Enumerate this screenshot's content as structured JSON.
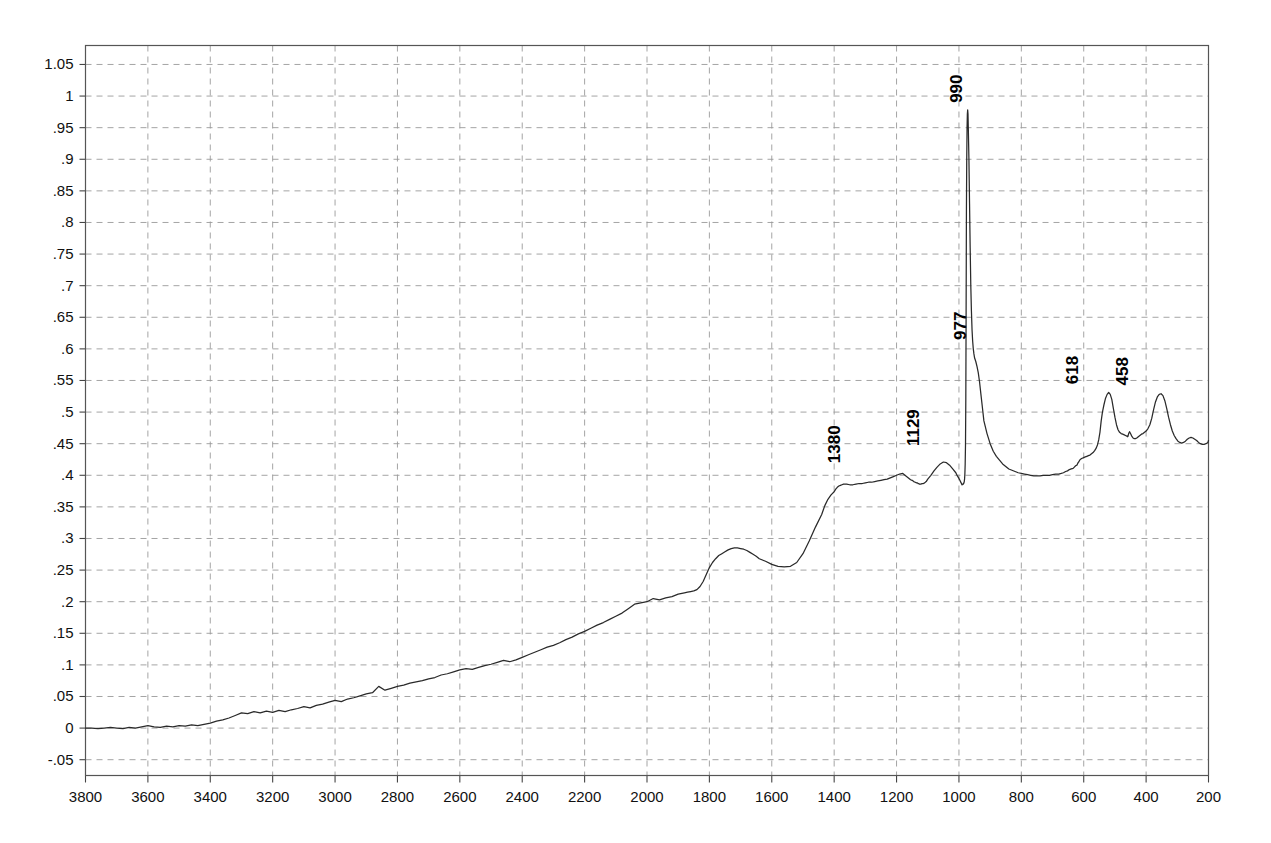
{
  "figure": {
    "kind": "spectrum-plot",
    "background": "#ffffff",
    "line_color": "#2a2a2a",
    "grid_color": "#9a9a9a"
  },
  "chart_data": {
    "type": "line",
    "title": "",
    "subtitle": "",
    "xlabel": "",
    "ylabel": "",
    "grid": true,
    "legend": "none",
    "xlim": [
      3800,
      200
    ],
    "ylim": [
      -0.075,
      1.08
    ],
    "x_axis_reversed": true,
    "xticks": [
      3800,
      3600,
      3400,
      3200,
      3000,
      2800,
      2600,
      2400,
      2200,
      2000,
      1800,
      1600,
      1400,
      1200,
      1000,
      800,
      600,
      400,
      200
    ],
    "xtick_labels": [
      "3800",
      "3600",
      "3400",
      "3200",
      "3000",
      "2800",
      "2600",
      "2400",
      "2200",
      "2000",
      "1800",
      "1600",
      "1400",
      "1200",
      "1000",
      "800",
      "600",
      "400",
      "200"
    ],
    "yticks": [
      1.05,
      1,
      0.95,
      0.9,
      0.85,
      0.8,
      0.75,
      0.7,
      0.65,
      0.6,
      0.55,
      0.5,
      0.45,
      0.4,
      0.35,
      0.3,
      0.25,
      0.2,
      0.15,
      0.1,
      0.05,
      0,
      -0.05
    ],
    "ytick_labels": [
      "1.05",
      "1",
      ".95",
      ".9",
      ".85",
      ".8",
      ".75",
      ".7",
      ".65",
      ".6",
      ".55",
      ".5",
      ".45",
      ".4",
      ".35",
      ".3",
      ".25",
      ".2",
      ".15",
      ".1",
      ".05",
      "0",
      "-.05"
    ],
    "annotations": [
      {
        "label": "1380",
        "x": 1380,
        "y": 0.405,
        "rotation": -90
      },
      {
        "label": "1129",
        "x": 1129,
        "y": 0.432,
        "rotation": -90
      },
      {
        "label": "990",
        "x": 990,
        "y": 0.975,
        "rotation": -90
      },
      {
        "label": "977",
        "x": 977,
        "y": 0.6,
        "rotation": -90
      },
      {
        "label": "618",
        "x": 618,
        "y": 0.53,
        "rotation": -90
      },
      {
        "label": "458",
        "x": 458,
        "y": 0.528,
        "rotation": -90
      }
    ],
    "x": [
      3800,
      3780,
      3760,
      3740,
      3720,
      3700,
      3680,
      3660,
      3640,
      3620,
      3600,
      3580,
      3560,
      3540,
      3520,
      3500,
      3480,
      3460,
      3440,
      3420,
      3400,
      3380,
      3360,
      3340,
      3320,
      3300,
      3280,
      3260,
      3240,
      3220,
      3200,
      3180,
      3160,
      3140,
      3120,
      3100,
      3080,
      3060,
      3040,
      3020,
      3000,
      2980,
      2960,
      2940,
      2920,
      2900,
      2880,
      2860,
      2840,
      2820,
      2800,
      2780,
      2760,
      2740,
      2720,
      2700,
      2680,
      2660,
      2640,
      2620,
      2600,
      2580,
      2560,
      2540,
      2520,
      2500,
      2480,
      2460,
      2440,
      2420,
      2400,
      2380,
      2360,
      2340,
      2320,
      2300,
      2280,
      2260,
      2240,
      2220,
      2200,
      2180,
      2160,
      2140,
      2120,
      2100,
      2080,
      2060,
      2040,
      2020,
      2000,
      1980,
      1960,
      1940,
      1920,
      1900,
      1880,
      1870,
      1860,
      1850,
      1840,
      1830,
      1820,
      1810,
      1800,
      1790,
      1780,
      1770,
      1760,
      1750,
      1740,
      1730,
      1720,
      1710,
      1700,
      1690,
      1680,
      1670,
      1660,
      1650,
      1640,
      1620,
      1600,
      1580,
      1560,
      1540,
      1520,
      1500,
      1480,
      1460,
      1440,
      1430,
      1420,
      1410,
      1400,
      1395,
      1390,
      1385,
      1380,
      1375,
      1370,
      1365,
      1360,
      1350,
      1340,
      1330,
      1320,
      1310,
      1300,
      1290,
      1280,
      1270,
      1260,
      1250,
      1240,
      1230,
      1220,
      1210,
      1200,
      1190,
      1180,
      1175,
      1170,
      1165,
      1160,
      1155,
      1150,
      1145,
      1140,
      1136,
      1133,
      1131,
      1129,
      1127,
      1125,
      1122,
      1118,
      1114,
      1110,
      1105,
      1100,
      1090,
      1080,
      1070,
      1060,
      1050,
      1040,
      1030,
      1020,
      1010,
      1005,
      1000,
      997,
      995,
      993,
      992,
      991,
      990.5,
      990,
      989.5,
      989,
      988,
      987,
      986,
      985,
      984,
      983,
      982,
      981,
      980,
      979,
      978,
      977,
      976,
      975,
      974,
      973,
      972,
      971,
      970,
      968,
      966,
      964,
      962,
      960,
      958,
      956,
      954,
      952,
      950,
      946,
      942,
      938,
      934,
      930,
      925,
      920,
      910,
      900,
      890,
      880,
      870,
      860,
      850,
      840,
      830,
      820,
      810,
      800,
      790,
      780,
      770,
      760,
      750,
      740,
      730,
      720,
      710,
      700,
      690,
      680,
      672,
      665,
      658,
      652,
      646,
      640,
      634,
      630,
      626,
      622,
      620,
      618,
      616,
      614,
      611,
      608,
      605,
      600,
      595,
      590,
      585,
      580,
      575,
      570,
      565,
      560,
      556,
      552,
      548,
      544,
      540,
      535,
      530,
      525,
      520,
      515,
      510,
      505,
      500,
      495,
      490,
      485,
      480,
      475,
      470,
      466,
      462,
      459,
      458,
      456,
      453,
      450,
      446,
      442,
      438,
      434,
      430,
      425,
      420,
      415,
      410,
      405,
      400,
      394,
      388,
      382,
      376,
      370,
      364,
      358,
      352,
      346,
      340,
      334,
      328,
      322,
      316,
      310,
      304,
      298,
      292,
      286,
      280,
      274,
      268,
      262,
      256,
      250,
      244,
      238,
      232,
      226,
      220,
      214,
      208,
      202,
      200
    ],
    "y": [
      0.0,
      0.0,
      -0.001,
      0.0,
      0.001,
      0.0,
      -0.001,
      0.001,
      0.0,
      0.002,
      0.004,
      0.002,
      0.001,
      0.003,
      0.002,
      0.004,
      0.003,
      0.005,
      0.004,
      0.006,
      0.008,
      0.011,
      0.013,
      0.016,
      0.02,
      0.024,
      0.023,
      0.026,
      0.024,
      0.027,
      0.025,
      0.028,
      0.026,
      0.029,
      0.031,
      0.034,
      0.032,
      0.036,
      0.038,
      0.041,
      0.044,
      0.042,
      0.046,
      0.048,
      0.051,
      0.054,
      0.056,
      0.066,
      0.06,
      0.063,
      0.066,
      0.068,
      0.071,
      0.073,
      0.075,
      0.078,
      0.08,
      0.084,
      0.086,
      0.089,
      0.092,
      0.094,
      0.093,
      0.096,
      0.099,
      0.101,
      0.104,
      0.107,
      0.105,
      0.108,
      0.112,
      0.116,
      0.12,
      0.124,
      0.128,
      0.131,
      0.135,
      0.14,
      0.144,
      0.149,
      0.153,
      0.158,
      0.163,
      0.167,
      0.172,
      0.177,
      0.182,
      0.189,
      0.196,
      0.198,
      0.2,
      0.205,
      0.203,
      0.206,
      0.208,
      0.212,
      0.214,
      0.215,
      0.216,
      0.217,
      0.219,
      0.224,
      0.232,
      0.243,
      0.254,
      0.262,
      0.268,
      0.273,
      0.276,
      0.279,
      0.282,
      0.284,
      0.285,
      0.285,
      0.284,
      0.283,
      0.281,
      0.278,
      0.275,
      0.272,
      0.268,
      0.264,
      0.259,
      0.256,
      0.255,
      0.256,
      0.262,
      0.276,
      0.296,
      0.318,
      0.338,
      0.352,
      0.362,
      0.369,
      0.374,
      0.378,
      0.381,
      0.383,
      0.384,
      0.385,
      0.386,
      0.386,
      0.386,
      0.385,
      0.385,
      0.386,
      0.387,
      0.387,
      0.388,
      0.389,
      0.389,
      0.39,
      0.391,
      0.392,
      0.393,
      0.394,
      0.396,
      0.398,
      0.4,
      0.402,
      0.403,
      0.401,
      0.399,
      0.397,
      0.395,
      0.393,
      0.392,
      0.39,
      0.389,
      0.388,
      0.388,
      0.387,
      0.387,
      0.386,
      0.386,
      0.386,
      0.387,
      0.387,
      0.388,
      0.39,
      0.394,
      0.4,
      0.407,
      0.413,
      0.418,
      0.421,
      0.42,
      0.416,
      0.41,
      0.404,
      0.399,
      0.395,
      0.392,
      0.39,
      0.388,
      0.387,
      0.386,
      0.385,
      0.385,
      0.385,
      0.386,
      0.386,
      0.386,
      0.386,
      0.387,
      0.388,
      0.39,
      0.394,
      0.402,
      0.418,
      0.448,
      0.52,
      0.66,
      0.82,
      0.9,
      0.95,
      0.972,
      0.978,
      0.972,
      0.95,
      0.9,
      0.83,
      0.76,
      0.7,
      0.66,
      0.63,
      0.612,
      0.6,
      0.592,
      0.586,
      0.58,
      0.572,
      0.562,
      0.548,
      0.53,
      0.508,
      0.486,
      0.466,
      0.45,
      0.438,
      0.43,
      0.424,
      0.418,
      0.414,
      0.41,
      0.408,
      0.406,
      0.404,
      0.403,
      0.402,
      0.401,
      0.4,
      0.399,
      0.399,
      0.399,
      0.4,
      0.4,
      0.4,
      0.401,
      0.402,
      0.402,
      0.403,
      0.404,
      0.406,
      0.407,
      0.409,
      0.41,
      0.411,
      0.413,
      0.415,
      0.416,
      0.418,
      0.42,
      0.421,
      0.423,
      0.425,
      0.426,
      0.427,
      0.428,
      0.429,
      0.43,
      0.431,
      0.432,
      0.434,
      0.436,
      0.439,
      0.443,
      0.448,
      0.456,
      0.468,
      0.486,
      0.5,
      0.512,
      0.522,
      0.528,
      0.531,
      0.528,
      0.52,
      0.506,
      0.492,
      0.48,
      0.472,
      0.468,
      0.466,
      0.465,
      0.464,
      0.463,
      0.462,
      0.461,
      0.462,
      0.466,
      0.469,
      0.466,
      0.462,
      0.459,
      0.458,
      0.458,
      0.459,
      0.461,
      0.463,
      0.465,
      0.466,
      0.468,
      0.47,
      0.474,
      0.48,
      0.49,
      0.504,
      0.516,
      0.524,
      0.528,
      0.529,
      0.526,
      0.518,
      0.506,
      0.492,
      0.48,
      0.47,
      0.463,
      0.458,
      0.454,
      0.452,
      0.451,
      0.452,
      0.454,
      0.457,
      0.459,
      0.46,
      0.459,
      0.457,
      0.455,
      0.452,
      0.45,
      0.449,
      0.449,
      0.45,
      0.452,
      0.455,
      0.457,
      0.458,
      0.458,
      0.457,
      0.455,
      0.453,
      0.452,
      0.452,
      0.453,
      0.454,
      0.456,
      0.458,
      0.459,
      0.46,
      0.46,
      0.461,
      0.461,
      0.462
    ]
  }
}
